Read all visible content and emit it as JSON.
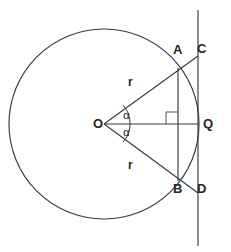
{
  "figure": {
    "type": "geometry-diagram",
    "background_color": "#ffffff",
    "stroke_color": "#3a3a3c",
    "text_color": "#262626",
    "width": 231,
    "height": 252
  },
  "labels": {
    "center": "O",
    "point_a": "A",
    "point_b": "B",
    "point_c": "C",
    "point_d": "D",
    "point_q": "Q",
    "radius_upper": "r",
    "radius_lower": "r",
    "angle_upper": "α",
    "angle_lower": "α"
  },
  "geometry": {
    "circle": {
      "cx": 104,
      "cy": 124,
      "r": 95
    },
    "center_point": {
      "x": 104,
      "y": 124
    },
    "tangent_line": {
      "x": 198,
      "y_top": 10,
      "y_bottom": 246
    },
    "chord_ab": {
      "x": 178,
      "y_top": 68,
      "y_bottom": 181
    },
    "point_a": {
      "x": 178,
      "y": 68
    },
    "point_b": {
      "x": 178,
      "y": 181
    },
    "point_c": {
      "x": 198,
      "y": 56
    },
    "point_d": {
      "x": 198,
      "y": 193
    },
    "point_q": {
      "x": 198,
      "y": 124
    },
    "axis_oq": {
      "x1": 104,
      "y1": 124,
      "x2": 198,
      "y2": 124
    },
    "ray_oc": {
      "x1": 104,
      "y1": 124,
      "x2": 198,
      "y2": 56
    },
    "ray_od": {
      "x1": 104,
      "y1": 124,
      "x2": 198,
      "y2": 193
    },
    "right_angle_marker": {
      "x": 166,
      "y": 112,
      "size": 12
    },
    "angle_arc_radius": 26
  },
  "label_positions": {
    "center": {
      "x": 93,
      "y": 117
    },
    "point_a": {
      "x": 173,
      "y": 43
    },
    "point_b": {
      "x": 173,
      "y": 182
    },
    "point_c": {
      "x": 197,
      "y": 42
    },
    "point_d": {
      "x": 197,
      "y": 182
    },
    "point_q": {
      "x": 203,
      "y": 117
    },
    "radius_upper": {
      "x": 128,
      "y": 76
    },
    "radius_lower": {
      "x": 128,
      "y": 159
    },
    "angle_upper": {
      "x": 123,
      "y": 110
    },
    "angle_lower": {
      "x": 123,
      "y": 127
    }
  }
}
